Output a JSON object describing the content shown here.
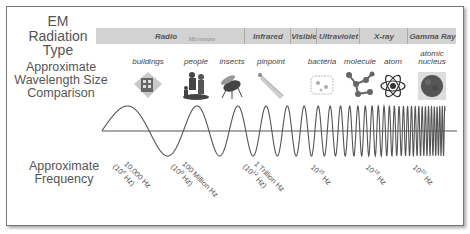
{
  "title": {
    "radiation_type": "EM Radiation Type",
    "wavelength": "Approximate Wavelength Size Comparison",
    "frequency": "Approximate Frequency"
  },
  "bands": [
    {
      "name": "Radio",
      "left": 0,
      "width": 140
    },
    {
      "name": "Microwave",
      "left": 76,
      "width": 60,
      "secondary": true
    },
    {
      "name": "Infrared",
      "left": 148,
      "width": 46
    },
    {
      "name": "Visible",
      "left": 194,
      "width": 26
    },
    {
      "name": "Ultraviolet",
      "left": 220,
      "width": 43
    },
    {
      "name": "X-ray",
      "left": 263,
      "width": 48
    },
    {
      "name": "Gamma Ray",
      "left": 311,
      "width": 49
    }
  ],
  "size_objects": [
    {
      "label": "buildings",
      "icon": "building-icon",
      "x": 148
    },
    {
      "label": "people",
      "icon": "people-icon",
      "x": 196
    },
    {
      "label": "insects",
      "icon": "insect-icon",
      "x": 232
    },
    {
      "label": "pinpoint",
      "icon": "pin-icon",
      "x": 271
    },
    {
      "label": "bacteria",
      "icon": "bacteria-icon",
      "x": 322
    },
    {
      "label": "molecule",
      "icon": "molecule-icon",
      "x": 360
    },
    {
      "label": "atom",
      "icon": "atom-icon",
      "x": 393
    },
    {
      "label": "atomic nucleus",
      "icon": "nucleus-icon",
      "x": 432
    }
  ],
  "frequencies": [
    {
      "line1": "10,000 Hz",
      "base": "(10",
      "exp": "4",
      "unit": " Hz)",
      "x": 128,
      "y": 160
    },
    {
      "line1": "100 Million Hz",
      "base": "(10",
      "exp": "8",
      "unit": " Hz)",
      "x": 186,
      "y": 160
    },
    {
      "line1": "1 Trillion Hz",
      "base": "(10",
      "exp": "12",
      "unit": " Hz)",
      "x": 258,
      "y": 160
    },
    {
      "line1": "",
      "base": "10",
      "exp": "15",
      "unit": " Hz",
      "x": 316,
      "y": 162
    },
    {
      "line1": "",
      "base": "10",
      "exp": "18",
      "unit": " Hz",
      "x": 371,
      "y": 162
    },
    {
      "line1": "",
      "base": "10",
      "exp": "20",
      "unit": " Hz",
      "x": 418,
      "y": 162
    }
  ],
  "wave": {
    "x_start": 102,
    "x_end": 445,
    "axis_y": 131,
    "amplitude": 25,
    "color": "#555555"
  },
  "colors": {
    "band_bar": "#d2d2d2",
    "text": "#555555",
    "border": "#777777"
  }
}
